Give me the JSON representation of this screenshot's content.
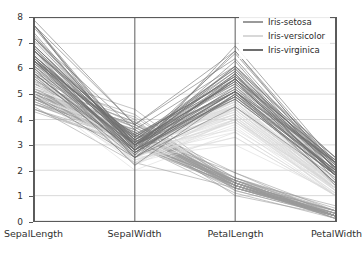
{
  "chart_data": {
    "type": "line",
    "subtype": "parallel-coordinates",
    "title": "",
    "xlabel": "",
    "ylabel": "",
    "grid": true,
    "ylim": [
      0,
      8
    ],
    "yticks": [
      0,
      1,
      2,
      3,
      4,
      5,
      6,
      7,
      8
    ],
    "ytick_labels": [
      "0",
      "1",
      "2",
      "3",
      "4",
      "5",
      "6",
      "7",
      "8"
    ],
    "axes": [
      "SepalLength",
      "SepalWidth",
      "PetalLength",
      "PetalWidth"
    ],
    "legend": {
      "position": "upper right",
      "entries": [
        {
          "name": "Iris-setosa",
          "color": "#9a9a9a"
        },
        {
          "name": "Iris-versicolor",
          "color": "#d8d8d8"
        },
        {
          "name": "Iris-virginica",
          "color": "#6e6e6e"
        }
      ]
    },
    "series": [
      {
        "name": "Iris-setosa",
        "color": "#9a9a9a",
        "axis_ranges": {
          "SepalLength": [
            4.3,
            5.8
          ],
          "SepalWidth": [
            2.3,
            4.4
          ],
          "PetalLength": [
            1.0,
            1.9
          ],
          "PetalWidth": [
            0.1,
            0.6
          ]
        },
        "rows": [
          [
            5.1,
            3.5,
            1.4,
            0.2
          ],
          [
            4.9,
            3.0,
            1.4,
            0.2
          ],
          [
            4.7,
            3.2,
            1.3,
            0.2
          ],
          [
            4.6,
            3.1,
            1.5,
            0.2
          ],
          [
            5.0,
            3.6,
            1.4,
            0.2
          ],
          [
            5.4,
            3.9,
            1.7,
            0.4
          ],
          [
            4.6,
            3.4,
            1.4,
            0.3
          ],
          [
            5.0,
            3.4,
            1.5,
            0.2
          ],
          [
            4.4,
            2.9,
            1.4,
            0.2
          ],
          [
            4.9,
            3.1,
            1.5,
            0.1
          ],
          [
            5.4,
            3.7,
            1.5,
            0.2
          ],
          [
            4.8,
            3.4,
            1.6,
            0.2
          ],
          [
            4.8,
            3.0,
            1.4,
            0.1
          ],
          [
            4.3,
            3.0,
            1.1,
            0.1
          ],
          [
            5.8,
            4.0,
            1.2,
            0.2
          ],
          [
            5.7,
            4.4,
            1.5,
            0.4
          ],
          [
            5.4,
            3.9,
            1.3,
            0.4
          ],
          [
            5.1,
            3.5,
            1.4,
            0.3
          ],
          [
            5.7,
            3.8,
            1.7,
            0.3
          ],
          [
            5.1,
            3.8,
            1.5,
            0.3
          ],
          [
            5.4,
            3.4,
            1.7,
            0.2
          ],
          [
            5.1,
            3.7,
            1.5,
            0.4
          ],
          [
            4.6,
            3.6,
            1.0,
            0.2
          ],
          [
            5.1,
            3.3,
            1.7,
            0.5
          ],
          [
            4.8,
            3.4,
            1.9,
            0.2
          ],
          [
            5.0,
            3.0,
            1.6,
            0.2
          ],
          [
            5.0,
            3.4,
            1.6,
            0.4
          ],
          [
            5.2,
            3.5,
            1.5,
            0.2
          ],
          [
            5.2,
            3.4,
            1.4,
            0.2
          ],
          [
            4.7,
            3.2,
            1.6,
            0.2
          ],
          [
            4.8,
            3.1,
            1.6,
            0.2
          ],
          [
            5.4,
            3.4,
            1.5,
            0.4
          ],
          [
            5.2,
            4.1,
            1.5,
            0.1
          ],
          [
            5.5,
            4.2,
            1.4,
            0.2
          ],
          [
            4.9,
            3.1,
            1.5,
            0.2
          ],
          [
            5.0,
            3.2,
            1.2,
            0.2
          ],
          [
            5.5,
            3.5,
            1.3,
            0.2
          ],
          [
            4.9,
            3.6,
            1.4,
            0.1
          ],
          [
            4.4,
            3.0,
            1.3,
            0.2
          ],
          [
            5.1,
            3.4,
            1.5,
            0.2
          ],
          [
            5.0,
            3.5,
            1.3,
            0.3
          ],
          [
            4.5,
            2.3,
            1.3,
            0.3
          ],
          [
            4.4,
            3.2,
            1.3,
            0.2
          ],
          [
            5.0,
            3.5,
            1.6,
            0.6
          ],
          [
            5.1,
            3.8,
            1.9,
            0.4
          ],
          [
            4.8,
            3.0,
            1.4,
            0.3
          ],
          [
            5.1,
            3.8,
            1.6,
            0.2
          ],
          [
            4.6,
            3.2,
            1.4,
            0.2
          ],
          [
            5.3,
            3.7,
            1.5,
            0.2
          ],
          [
            5.0,
            3.3,
            1.4,
            0.2
          ]
        ]
      },
      {
        "name": "Iris-versicolor",
        "color": "#d8d8d8",
        "axis_ranges": {
          "SepalLength": [
            4.9,
            7.0
          ],
          "SepalWidth": [
            2.0,
            3.4
          ],
          "PetalLength": [
            3.0,
            5.1
          ],
          "PetalWidth": [
            1.0,
            1.8
          ]
        },
        "rows": [
          [
            7.0,
            3.2,
            4.7,
            1.4
          ],
          [
            6.4,
            3.2,
            4.5,
            1.5
          ],
          [
            6.9,
            3.1,
            4.9,
            1.5
          ],
          [
            5.5,
            2.3,
            4.0,
            1.3
          ],
          [
            6.5,
            2.8,
            4.6,
            1.5
          ],
          [
            5.7,
            2.8,
            4.5,
            1.3
          ],
          [
            6.3,
            3.3,
            4.7,
            1.6
          ],
          [
            4.9,
            2.4,
            3.3,
            1.0
          ],
          [
            6.6,
            2.9,
            4.6,
            1.3
          ],
          [
            5.2,
            2.7,
            3.9,
            1.4
          ],
          [
            5.0,
            2.0,
            3.5,
            1.0
          ],
          [
            5.9,
            3.0,
            4.2,
            1.5
          ],
          [
            6.0,
            2.2,
            4.0,
            1.0
          ],
          [
            6.1,
            2.9,
            4.7,
            1.4
          ],
          [
            5.6,
            2.9,
            3.6,
            1.3
          ],
          [
            6.7,
            3.1,
            4.4,
            1.4
          ],
          [
            5.6,
            3.0,
            4.5,
            1.5
          ],
          [
            5.8,
            2.7,
            4.1,
            1.0
          ],
          [
            6.2,
            2.2,
            4.5,
            1.5
          ],
          [
            5.6,
            2.5,
            3.9,
            1.1
          ],
          [
            5.9,
            3.2,
            4.8,
            1.8
          ],
          [
            6.1,
            2.8,
            4.0,
            1.3
          ],
          [
            6.3,
            2.5,
            4.9,
            1.5
          ],
          [
            6.1,
            2.8,
            4.7,
            1.2
          ],
          [
            6.4,
            2.9,
            4.3,
            1.3
          ],
          [
            6.6,
            3.0,
            4.4,
            1.4
          ],
          [
            6.8,
            2.8,
            4.8,
            1.4
          ],
          [
            6.7,
            3.0,
            5.0,
            1.7
          ],
          [
            6.0,
            2.9,
            4.5,
            1.5
          ],
          [
            5.7,
            2.6,
            3.5,
            1.0
          ],
          [
            5.5,
            2.4,
            3.8,
            1.1
          ],
          [
            5.5,
            2.4,
            3.7,
            1.0
          ],
          [
            5.8,
            2.7,
            3.9,
            1.2
          ],
          [
            6.0,
            2.7,
            5.1,
            1.6
          ],
          [
            5.4,
            3.0,
            4.5,
            1.5
          ],
          [
            6.0,
            3.4,
            4.5,
            1.6
          ],
          [
            6.7,
            3.1,
            4.7,
            1.5
          ],
          [
            6.3,
            2.3,
            4.4,
            1.3
          ],
          [
            5.6,
            3.0,
            4.1,
            1.3
          ],
          [
            5.5,
            2.5,
            4.0,
            1.3
          ],
          [
            5.5,
            2.6,
            4.4,
            1.2
          ],
          [
            6.1,
            3.0,
            4.6,
            1.4
          ],
          [
            5.8,
            2.6,
            4.0,
            1.2
          ],
          [
            5.0,
            2.3,
            3.3,
            1.0
          ],
          [
            5.6,
            2.7,
            4.2,
            1.3
          ],
          [
            5.7,
            3.0,
            4.2,
            1.2
          ],
          [
            5.7,
            2.9,
            4.2,
            1.3
          ],
          [
            6.2,
            2.9,
            4.3,
            1.3
          ],
          [
            5.1,
            2.5,
            3.0,
            1.1
          ],
          [
            5.7,
            2.8,
            4.1,
            1.3
          ]
        ]
      },
      {
        "name": "Iris-virginica",
        "color": "#6e6e6e",
        "axis_ranges": {
          "SepalLength": [
            4.9,
            7.9
          ],
          "SepalWidth": [
            2.2,
            3.8
          ],
          "PetalLength": [
            4.5,
            6.9
          ],
          "PetalWidth": [
            1.4,
            2.5
          ]
        },
        "rows": [
          [
            6.3,
            3.3,
            6.0,
            2.5
          ],
          [
            5.8,
            2.7,
            5.1,
            1.9
          ],
          [
            7.1,
            3.0,
            5.9,
            2.1
          ],
          [
            6.3,
            2.9,
            5.6,
            1.8
          ],
          [
            6.5,
            3.0,
            5.8,
            2.2
          ],
          [
            7.6,
            3.0,
            6.6,
            2.1
          ],
          [
            4.9,
            2.5,
            4.5,
            1.7
          ],
          [
            7.3,
            2.9,
            6.3,
            1.8
          ],
          [
            6.7,
            2.5,
            5.8,
            1.8
          ],
          [
            7.2,
            3.6,
            6.1,
            2.5
          ],
          [
            6.5,
            3.2,
            5.1,
            2.0
          ],
          [
            6.4,
            2.7,
            5.3,
            1.9
          ],
          [
            6.8,
            3.0,
            5.5,
            2.1
          ],
          [
            5.7,
            2.5,
            5.0,
            2.0
          ],
          [
            5.8,
            2.8,
            5.1,
            2.4
          ],
          [
            6.4,
            3.2,
            5.3,
            2.3
          ],
          [
            6.5,
            3.0,
            5.5,
            1.8
          ],
          [
            7.7,
            3.8,
            6.7,
            2.2
          ],
          [
            7.7,
            2.6,
            6.9,
            2.3
          ],
          [
            6.0,
            2.2,
            5.0,
            1.5
          ],
          [
            6.9,
            3.2,
            5.7,
            2.3
          ],
          [
            5.6,
            2.8,
            4.9,
            2.0
          ],
          [
            7.7,
            2.8,
            6.7,
            2.0
          ],
          [
            6.3,
            2.7,
            4.9,
            1.8
          ],
          [
            6.7,
            3.3,
            5.7,
            2.1
          ],
          [
            7.2,
            3.2,
            6.0,
            1.8
          ],
          [
            6.2,
            2.8,
            4.8,
            1.8
          ],
          [
            6.1,
            3.0,
            4.9,
            1.8
          ],
          [
            6.4,
            2.8,
            5.6,
            2.1
          ],
          [
            7.2,
            3.0,
            5.8,
            1.6
          ],
          [
            7.4,
            2.8,
            6.1,
            1.9
          ],
          [
            7.9,
            3.8,
            6.4,
            2.0
          ],
          [
            6.4,
            2.8,
            5.6,
            2.2
          ],
          [
            6.3,
            2.8,
            5.1,
            1.5
          ],
          [
            6.1,
            2.6,
            5.6,
            1.4
          ],
          [
            7.7,
            3.0,
            6.1,
            2.3
          ],
          [
            6.3,
            3.4,
            5.6,
            2.4
          ],
          [
            6.4,
            3.1,
            5.5,
            1.8
          ],
          [
            6.0,
            3.0,
            4.8,
            1.8
          ],
          [
            6.9,
            3.1,
            5.4,
            2.1
          ],
          [
            6.7,
            3.1,
            5.6,
            2.4
          ],
          [
            6.9,
            3.1,
            5.1,
            2.3
          ],
          [
            5.8,
            2.7,
            5.1,
            1.9
          ],
          [
            6.8,
            3.2,
            5.9,
            2.3
          ],
          [
            6.7,
            3.3,
            5.7,
            2.5
          ],
          [
            6.7,
            3.0,
            5.2,
            2.3
          ],
          [
            6.3,
            2.5,
            5.0,
            1.9
          ],
          [
            6.5,
            3.0,
            5.2,
            2.0
          ],
          [
            6.2,
            3.4,
            5.4,
            2.3
          ],
          [
            5.9,
            3.0,
            5.1,
            1.8
          ]
        ]
      }
    ]
  },
  "style": {
    "axis_line_color": "#5a5a5a",
    "grid_color": "#d9d9d9",
    "tick_text_color": "#303030",
    "background": "#ffffff"
  }
}
